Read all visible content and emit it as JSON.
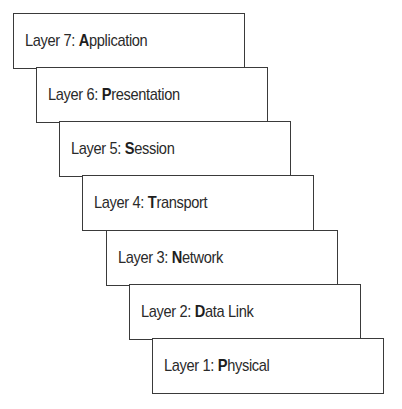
{
  "diagram": {
    "type": "stacked-staircase",
    "layers": [
      {
        "prefix": "Layer 7: ",
        "initial": "A",
        "rest": "pplication",
        "left": 13,
        "top": 13
      },
      {
        "prefix": "Layer 6: ",
        "initial": "P",
        "rest": "resentation",
        "left": 36,
        "top": 67
      },
      {
        "prefix": "Layer 5: ",
        "initial": "S",
        "rest": "ession",
        "left": 59,
        "top": 121
      },
      {
        "prefix": "Layer 4: ",
        "initial": "T",
        "rest": "ransport",
        "left": 82,
        "top": 175
      },
      {
        "prefix": "Layer 3: ",
        "initial": "N",
        "rest": "etwork",
        "left": 106,
        "top": 230
      },
      {
        "prefix": "Layer 2: ",
        "initial": "D",
        "rest": "ata Link",
        "left": 129,
        "top": 284
      },
      {
        "prefix": "Layer 1: ",
        "initial": "P",
        "rest": "hysical",
        "left": 152,
        "top": 338
      }
    ],
    "colors": {
      "border": "#3a3a3a",
      "text": "#2a2a2a",
      "background": "#ffffff"
    }
  }
}
